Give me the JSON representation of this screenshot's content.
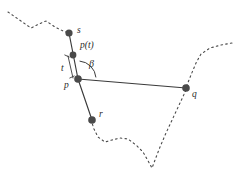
{
  "figure": {
    "type": "geometry-diagram",
    "background": "#ffffff",
    "ink_color": "#3a3a3a",
    "dot_color": "#4a4a4a",
    "width": 238,
    "height": 174
  },
  "labels": {
    "s": "s",
    "p_of_t": "p(t)",
    "t": "t",
    "beta": "β",
    "p": "p",
    "q": "q",
    "r": "r"
  },
  "label_positions": {
    "s": {
      "x": 77,
      "y": 26
    },
    "p_of_t": {
      "x": 80,
      "y": 41
    },
    "t": {
      "x": 61,
      "y": 64
    },
    "beta": {
      "x": 89,
      "y": 59
    },
    "p": {
      "x": 64,
      "y": 81
    },
    "q": {
      "x": 192,
      "y": 90
    },
    "r": {
      "x": 99,
      "y": 110
    }
  },
  "points": [
    {
      "name": "s",
      "x": 69,
      "y": 33,
      "r": 3.6
    },
    {
      "name": "p(t)",
      "x": 73,
      "y": 55,
      "r": 3.4
    },
    {
      "name": "p",
      "x": 78,
      "y": 79,
      "r": 3.8
    },
    {
      "name": "q",
      "x": 186,
      "y": 88,
      "r": 3.8
    },
    {
      "name": "r",
      "x": 92,
      "y": 120,
      "r": 3.8
    }
  ],
  "solid_segments": [
    {
      "name": "s-to-p",
      "from": "s",
      "to": "p",
      "x1": 69,
      "y1": 33,
      "x2": 78,
      "y2": 79
    },
    {
      "name": "p-to-q",
      "from": "p",
      "to": "q",
      "x1": 78,
      "y1": 79,
      "x2": 186,
      "y2": 88
    },
    {
      "name": "p-to-r",
      "from": "p",
      "to": "r",
      "x1": 78,
      "y1": 79,
      "x2": 92,
      "y2": 120
    }
  ],
  "measure_bar": {
    "name": "t-extent",
    "x1": 68,
    "y1": 56,
    "x2": 73,
    "y2": 78,
    "tick_top": {
      "x": 67,
      "y": 56
    },
    "tick_bottom": {
      "x": 72,
      "y": 77
    }
  },
  "angle_arc": {
    "name": "beta-arc",
    "vertex_x": 78,
    "vertex_y": 79,
    "radius": 18,
    "start_deg": -85,
    "end_deg": -5
  },
  "dotted_boundary": {
    "left_path": "M 8,12 L 21,21 L 31,28 L 39,24 L 46,21 L 55,27 L 63,31 L 69,33",
    "right_upper_path": "M 232,43 L 221,45 L 210,48 L 201,54 L 196,63 L 191,75 L 187,85",
    "lower_path": "M 186,90 L 180,103 L 173,118 L 166,133 L 160,147 L 155,160 L 152,168 L 147,159 L 143,152 L 136,145 L 128,139 L 120,138 L 112,140 L 105,142 L 98,137 L 94,129 L 92,123",
    "dash": "1.6 3.2"
  }
}
